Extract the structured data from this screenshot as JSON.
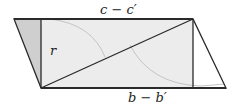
{
  "diagram": {
    "labels": {
      "top": "c − c′",
      "bottom": "b − b′",
      "side": "r"
    },
    "colors": {
      "stroke": "#2a2a2a",
      "rect_fill": "#ececec",
      "left_triangle_fill": "#cfcfcf",
      "arc": "#c4c4c4",
      "background": "#ffffff"
    },
    "shapes": {
      "parallelogram": [
        [
          14,
          19
        ],
        [
          193,
          19
        ],
        [
          226,
          88
        ],
        [
          41,
          88
        ]
      ],
      "rectangle": {
        "x": 41,
        "y": 19,
        "width": 152,
        "height": 69
      },
      "diagonal": [
        [
          41,
          88
        ],
        [
          193,
          19
        ]
      ],
      "left_triangle": [
        [
          14,
          19
        ],
        [
          41,
          19
        ],
        [
          41,
          88
        ]
      ]
    }
  }
}
